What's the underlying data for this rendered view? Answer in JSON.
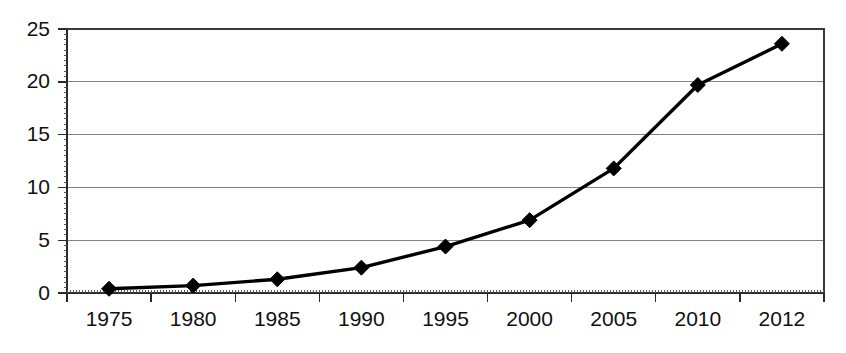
{
  "chart_data": {
    "type": "line",
    "title": "",
    "subtitle": "",
    "xlabel": "",
    "ylabel": "",
    "categories": [
      "1975",
      "1980",
      "1985",
      "1990",
      "1995",
      "2000",
      "2005",
      "2010",
      "2012"
    ],
    "values": [
      0.4,
      0.7,
      1.3,
      2.4,
      4.4,
      6.9,
      11.8,
      19.7,
      23.6
    ],
    "series": [
      {
        "name": "",
        "values": [
          0.4,
          0.7,
          1.3,
          2.4,
          4.4,
          6.9,
          11.8,
          19.7,
          23.6
        ]
      }
    ],
    "ylim": [
      0,
      25
    ],
    "yticks": [
      0,
      5,
      10,
      15,
      20,
      25
    ],
    "ytick_labels": [
      "0",
      "5",
      "10",
      "15",
      "20",
      "25"
    ],
    "xtick_labels": [
      "1975",
      "1980",
      "1985",
      "1990",
      "1995",
      "2000",
      "2005",
      "2010",
      "2012"
    ],
    "grid": "horizontal",
    "legend": "none",
    "marker": "diamond",
    "line_color": "#000000",
    "marker_color": "#000000",
    "gridline_color": "#808080",
    "axis_color": "#2a2a2a",
    "background_color": "#ffffff",
    "annotations": []
  },
  "axes": {
    "y_axis_name": "value-axis",
    "x_axis_name": "category-axis"
  }
}
